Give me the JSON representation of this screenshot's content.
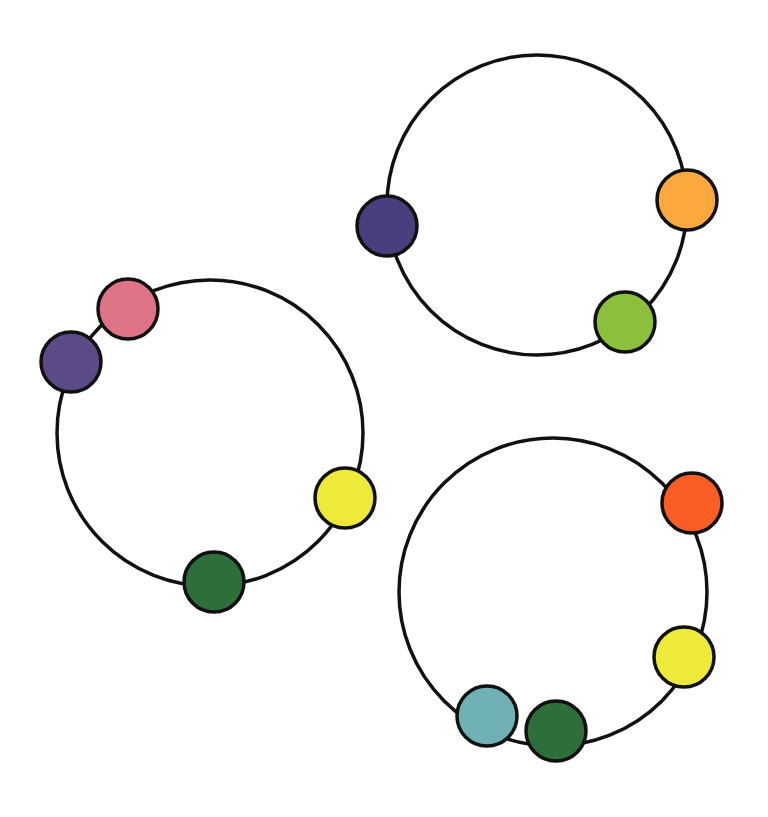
{
  "diagram": {
    "background": "#ffffff",
    "ring_stroke": "#111111",
    "ring_stroke_width": 3.5,
    "bead_stroke": "#111111",
    "bead_stroke_width": 3.5,
    "bead_radius": 30,
    "rings": [
      {
        "id": "ring-top-right",
        "cx": 537,
        "cy": 205,
        "r": 150,
        "beads": [
          {
            "name": "navy",
            "color": "#4a3f7e",
            "x": 387,
            "y": 226
          },
          {
            "name": "orange",
            "color": "#fba93f",
            "x": 687,
            "y": 200
          },
          {
            "name": "lime-green",
            "color": "#8cbf3c",
            "x": 625,
            "y": 322
          }
        ]
      },
      {
        "id": "ring-left",
        "cx": 210,
        "cy": 433,
        "r": 153,
        "beads": [
          {
            "name": "pink",
            "color": "#e07487",
            "x": 128,
            "y": 309
          },
          {
            "name": "purple",
            "color": "#5b4a86",
            "x": 71,
            "y": 362
          },
          {
            "name": "yellow",
            "color": "#eeea3a",
            "x": 345,
            "y": 498
          },
          {
            "name": "dark-green",
            "color": "#2e6e3a",
            "x": 214,
            "y": 582
          }
        ]
      },
      {
        "id": "ring-bottom-right",
        "cx": 553,
        "cy": 592,
        "r": 154,
        "beads": [
          {
            "name": "orange-red",
            "color": "#fb5e25",
            "x": 692,
            "y": 503
          },
          {
            "name": "yellow",
            "color": "#eeea3a",
            "x": 684,
            "y": 657
          },
          {
            "name": "teal",
            "color": "#6fb1b5",
            "x": 487,
            "y": 716
          },
          {
            "name": "dark-green",
            "color": "#2e6e3a",
            "x": 556,
            "y": 731
          }
        ]
      }
    ]
  }
}
